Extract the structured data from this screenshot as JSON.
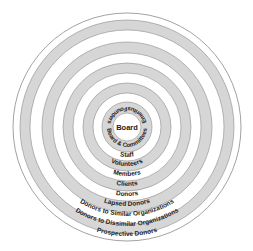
{
  "diagram": {
    "center_label": "Board",
    "inner_ring": {
      "bottom_label": "Board & Committees",
      "top_left_label": "Founders",
      "top_right_label": "Emeritus"
    },
    "rings": [
      {
        "label": "Staff"
      },
      {
        "label": "Volunteers"
      },
      {
        "label": "Members"
      },
      {
        "label": "Clients"
      },
      {
        "label": "Donors"
      },
      {
        "label": "Lapsed Donors"
      },
      {
        "label": "Donors to Similar Organizations"
      },
      {
        "label": "Donors to Dissimilar Organizations"
      },
      {
        "label": "Prospective Donors"
      }
    ],
    "colors": {
      "band_grey": "#d6d6d6",
      "line": "#8a8a8a",
      "background": "#ffffff",
      "text": "#222222"
    }
  }
}
